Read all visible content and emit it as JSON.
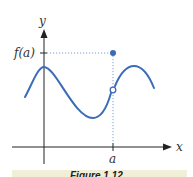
{
  "figure": {
    "y_axis_label": "y",
    "x_axis_label": "x",
    "y_tick_label": "f(a)",
    "x_tick_label": "a",
    "caption": "Figure 1.12",
    "colors": {
      "curve": "#3b6cb7",
      "axes": "#222222",
      "guide": "#7f9fd0",
      "caption_band": "#f2efd8"
    },
    "elements": {
      "curve": "smooth wave with a removable discontinuity at x = a",
      "open_point": "hole on curve at x = a",
      "filled_point": "f(a) plotted above the curve at x = a"
    }
  }
}
